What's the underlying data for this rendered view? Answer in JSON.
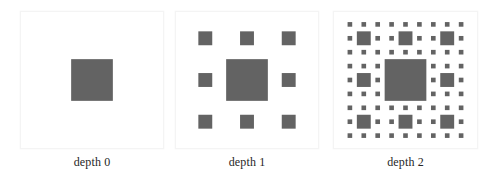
{
  "figure": {
    "background_color": "#ffffff",
    "width": 491,
    "height": 182
  },
  "style": {
    "square_color": "#636363",
    "panel_border_color": "#f4f4f4",
    "panel_fill_color": "#ffffff",
    "caption_color": "#262626"
  },
  "panels": [
    {
      "id": "panel-depth-0",
      "caption": "depth 0",
      "depth": 0,
      "square_count": 1,
      "left": 20,
      "top": 11,
      "width": 144,
      "height": 138
    },
    {
      "id": "panel-depth-1",
      "caption": "depth 1",
      "depth": 1,
      "square_count": 9,
      "left": 175,
      "top": 11,
      "width": 144,
      "height": 138
    },
    {
      "id": "panel-depth-2",
      "caption": "depth 2",
      "depth": 2,
      "square_count": 81,
      "left": 333,
      "top": 11,
      "width": 145,
      "height": 138
    }
  ],
  "chart_data": {
    "type": "diagram",
    "subtype": "recursive-square-fractal",
    "title": "",
    "xlabel": "",
    "ylabel": "",
    "rule": {
      "grid": 3,
      "center_fraction": 0.3333,
      "satellite_fraction": 0.1111,
      "satellite_positions": [
        [
          0,
          0
        ],
        [
          1,
          0
        ],
        [
          2,
          0
        ],
        [
          0,
          1
        ],
        [
          2,
          1
        ],
        [
          0,
          2
        ],
        [
          1,
          2
        ],
        [
          2,
          2
        ]
      ]
    },
    "categories": [
      "depth 0",
      "depth 1",
      "depth 2"
    ],
    "values": [
      1,
      9,
      81
    ],
    "series": [
      {
        "name": "number of drawn squares",
        "values": [
          1,
          9,
          81
        ]
      }
    ],
    "legend": [],
    "grid": false
  }
}
